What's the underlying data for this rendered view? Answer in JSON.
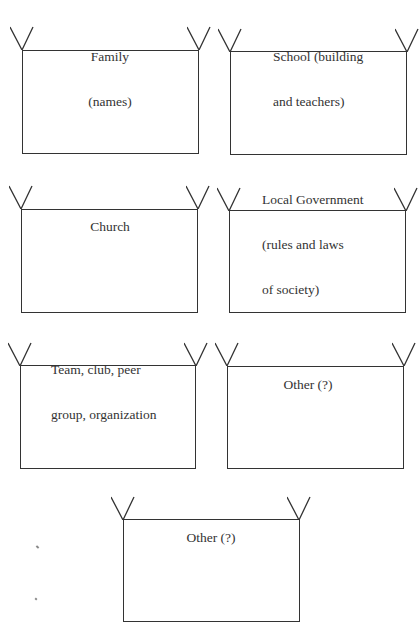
{
  "worksheet": {
    "frames": [
      {
        "id": "family",
        "label_lines": [
          "Family",
          "(names)"
        ]
      },
      {
        "id": "school",
        "label_lines": [
          "School (building",
          "and teachers)"
        ]
      },
      {
        "id": "church",
        "label_lines": [
          "Church"
        ]
      },
      {
        "id": "local-government",
        "label_lines": [
          "Local Government",
          "(rules and laws",
          "of society)"
        ]
      },
      {
        "id": "team-club",
        "label_lines": [
          "Team, club, peer",
          "group, organization"
        ]
      },
      {
        "id": "other-1",
        "label_lines": [
          "Other (?)"
        ]
      },
      {
        "id": "other-2",
        "label_lines": [
          "Other (?)"
        ]
      }
    ],
    "line_color": "#333333",
    "background": "#ffffff"
  }
}
